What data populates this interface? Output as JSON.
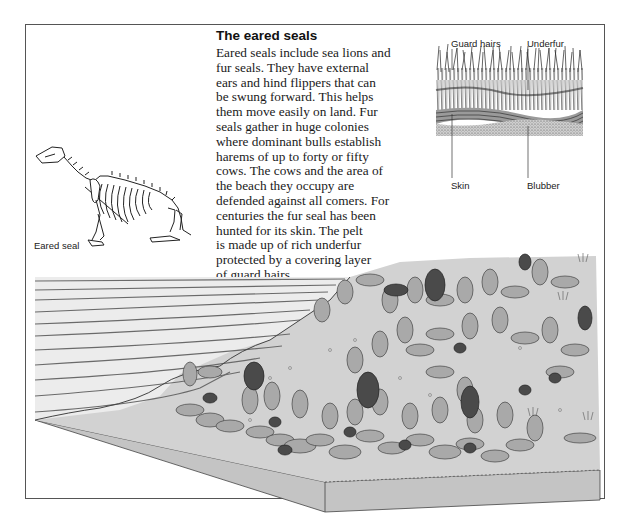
{
  "article": {
    "title": "The eared seals",
    "lines": [
      "Eared seals include sea lions and",
      "fur seals. They have external",
      "ears and hind flippers that can",
      "be swung forward. This helps",
      "them move easily on land. Fur",
      "seals gather in huge colonies",
      "where dominant bulls establish",
      "harems of up to forty or fifty",
      "cows. The cows and the area of",
      "the beach they occupy are",
      "defended against all comers. For",
      "centuries the fur seal has been",
      "hunted for its skin. The pelt",
      "is made up of rich underfur",
      "protected by a covering layer",
      "of guard hairs."
    ]
  },
  "skeleton_figure": {
    "caption": "Eared seal"
  },
  "fur_diagram": {
    "labels": {
      "guard_hairs": "Guard hairs",
      "underfur": "Underfur",
      "skin": "Skin",
      "blubber": "Blubber"
    }
  },
  "colony_illustration": {
    "colors": {
      "sea": "#ececec",
      "beach": "#d2d2d2",
      "block_side": "#c8c8c8",
      "cow_seal": "#a9a9a9",
      "bull_seal": "#4a4a4a",
      "wave_line": "#666666"
    }
  }
}
